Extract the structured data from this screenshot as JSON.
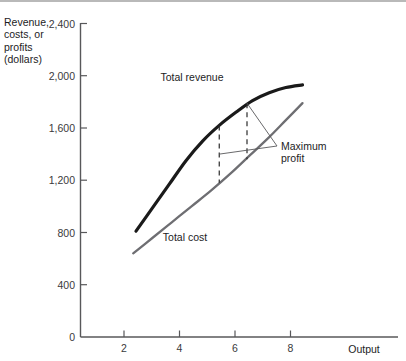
{
  "chart_data": {
    "type": "line",
    "title": "",
    "xlabel": "Output",
    "ylabel": "Revenue, costs, or profits (dollars)",
    "ylabel_lines": [
      "Revenue,",
      "costs, or",
      "profits",
      "(dollars)"
    ],
    "xlim": [
      0,
      10
    ],
    "ylim": [
      0,
      2400
    ],
    "grid": false,
    "legend": "inline-labels",
    "x_ticks": [
      2,
      4,
      6,
      8
    ],
    "x_tick_labels": [
      "2",
      "4",
      "6",
      "8"
    ],
    "y_ticks": [
      0,
      400,
      800,
      1200,
      1600,
      2000,
      2400
    ],
    "y_tick_labels": [
      "0",
      "400",
      "800",
      "1,200",
      "1,600",
      "2,000",
      "2,400"
    ],
    "x_origin_label": "0",
    "series": [
      {
        "name": "Total revenue",
        "color": "#1a1a1a",
        "x": [
          2.0,
          2.6,
          3.2,
          3.8,
          4.4,
          5.0,
          5.6,
          6.2,
          6.8,
          7.4,
          8.0
        ],
        "values": [
          810,
          990,
          1170,
          1350,
          1500,
          1620,
          1720,
          1810,
          1870,
          1910,
          1930
        ]
      },
      {
        "name": "Total cost",
        "color": "#6e6e72",
        "x": [
          1.9,
          2.6,
          3.3,
          4.0,
          4.7,
          5.4,
          6.1,
          6.8,
          7.4,
          8.0
        ],
        "values": [
          640,
          760,
          880,
          1000,
          1120,
          1250,
          1390,
          1530,
          1660,
          1790
        ]
      }
    ],
    "annotations": [
      {
        "label": "Maximum profit",
        "label_lines": [
          "Maximum",
          "profit"
        ],
        "gap_markers": [
          {
            "x": 5.0,
            "top_value": 1620,
            "bottom_value": 1180
          },
          {
            "x": 6.0,
            "top_value": 1790,
            "bottom_value": 1360
          }
        ]
      }
    ]
  },
  "labels": {
    "total_revenue": "Total revenue",
    "total_cost": "Total cost",
    "maximum_profit_line1": "Maximum",
    "maximum_profit_line2": "profit",
    "output_axis": "Output",
    "y_axis_line1": "Revenue,",
    "y_axis_line2": "costs, or",
    "y_axis_line3": "profits",
    "y_axis_line4": "(dollars)",
    "y_0": "0",
    "y_400": "400",
    "y_800": "800",
    "y_1200": "1,200",
    "y_1600": "1,600",
    "y_2000": "2,000",
    "y_2400": "2,400",
    "x_2": "2",
    "x_4": "4",
    "x_6": "6",
    "x_8": "8"
  }
}
